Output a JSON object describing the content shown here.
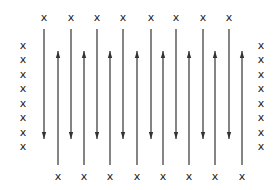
{
  "diagram": {
    "title": "",
    "marker_glyph": "x",
    "colors": {
      "stroke": "#333333",
      "marker": "#222222",
      "background": "#ffffff"
    },
    "top_markers": {
      "count": 8,
      "xs": [
        44,
        71,
        97,
        123,
        151,
        176,
        203,
        229
      ],
      "y": 17
    },
    "bottom_markers": {
      "count": 8,
      "xs": [
        58,
        84,
        110,
        137,
        163,
        189,
        215,
        242
      ],
      "y": 176
    },
    "left_markers": {
      "count": 8,
      "x": 23,
      "ys": [
        45,
        59,
        74,
        88,
        103,
        117,
        132,
        146
      ]
    },
    "right_markers": {
      "count": 8,
      "x": 261,
      "ys": [
        45,
        59,
        74,
        88,
        103,
        117,
        132,
        146
      ]
    },
    "down_arrows": {
      "count": 8,
      "xs": [
        44,
        71,
        97,
        123,
        151,
        176,
        203,
        229
      ],
      "y_start": 29,
      "y_end": 139,
      "direction": "down"
    },
    "up_arrows": {
      "count": 8,
      "xs": [
        58,
        84,
        110,
        137,
        163,
        189,
        215,
        242
      ],
      "y_start": 165,
      "y_end": 51,
      "direction": "up"
    }
  }
}
